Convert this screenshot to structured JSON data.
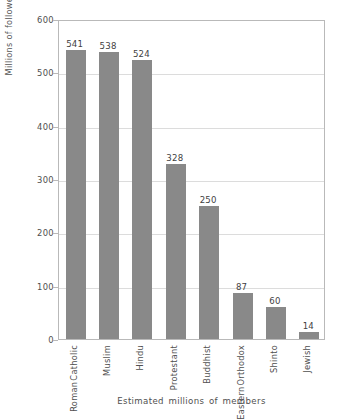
{
  "chart_data": {
    "type": "bar",
    "title": "",
    "subtitle": "",
    "xlabel": "Estimated millions of members",
    "ylabel": "Millions of followers",
    "categories": [
      "Roman Catholic",
      "Muslim",
      "Hindu",
      "Protestant",
      "Buddhist",
      "Eastern Orthodox",
      "Shinto",
      "Jewish"
    ],
    "category_lines": [
      [
        "Roman",
        "Catholic"
      ],
      [
        "Muslim"
      ],
      [
        "Hindu"
      ],
      [
        "Protestant"
      ],
      [
        "Buddhist"
      ],
      [
        "Eastern",
        "Orthodox"
      ],
      [
        "Shinto"
      ],
      [
        "Jewish"
      ]
    ],
    "values": [
      541,
      538,
      524,
      328,
      250,
      87,
      60,
      14
    ],
    "value_labels": [
      "541",
      "538",
      "524",
      "328",
      "250",
      "87",
      "60",
      "14"
    ],
    "ylim": [
      0,
      600
    ],
    "yticks": [
      0,
      100,
      200,
      300,
      400,
      500,
      600
    ],
    "ytick_labels": [
      "0",
      "100",
      "200",
      "300",
      "400",
      "500",
      "600"
    ],
    "grid": "horizontal",
    "legend": "none",
    "bar_color": "#898989",
    "frame_color": "#b9b9b9",
    "grid_color": "#dcdcdc",
    "label_rotation": 90
  }
}
